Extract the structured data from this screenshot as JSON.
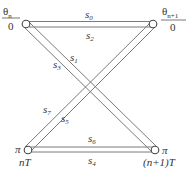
{
  "diagram": {
    "type": "trellis-transition",
    "nodes": [
      {
        "id": "tl",
        "top_label": "θ",
        "top_sub": "n",
        "bottom_label": "0"
      },
      {
        "id": "tr",
        "top_label": "θ",
        "top_sub": "n+1",
        "bottom_label": "0"
      },
      {
        "id": "bl",
        "side_label": "π",
        "below_label": "nT"
      },
      {
        "id": "br",
        "side_label": "π",
        "below_label": "(n+1)T"
      }
    ],
    "edges": [
      {
        "label": "s",
        "sub": "0",
        "from": "tl",
        "to": "tr"
      },
      {
        "label": "s",
        "sub": "2",
        "from": "tr",
        "to": "tl"
      },
      {
        "label": "s",
        "sub": "1",
        "from": "tl",
        "to": "br"
      },
      {
        "label": "s",
        "sub": "3",
        "from": "tl",
        "to": "br"
      },
      {
        "label": "s",
        "sub": "7",
        "from": "bl",
        "to": "tr"
      },
      {
        "label": "s",
        "sub": "5",
        "from": "bl",
        "to": "tr"
      },
      {
        "label": "s",
        "sub": "6",
        "from": "bl",
        "to": "br"
      },
      {
        "label": "s",
        "sub": "4",
        "from": "br",
        "to": "bl"
      }
    ],
    "colors": {
      "line": "#7a7a7a",
      "node": "#444444",
      "text": "#333333"
    }
  }
}
